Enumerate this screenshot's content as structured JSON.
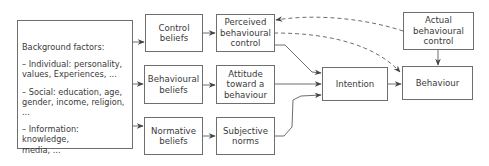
{
  "diagram": {
    "background": {
      "heading": "Background factors:",
      "items": [
        "– Individual: personality,\nvalues, Experiences, ...",
        "– Social: education, age,\ngender, income, religion, ...",
        "– Information: knowledge,\nmedia, ..."
      ]
    },
    "nodes": {
      "control_beliefs": "Control\nbeliefs",
      "behavioural_beliefs": "Behavioural\nbeliefs",
      "normative_beliefs": "Normative\nbeliefs",
      "perceived_control": "Perceived\nbehavioural\ncontrol",
      "attitude": "Attitude\ntoward a\nbehaviour",
      "subjective_norms": "Subjective\nnorms",
      "intention": "Intention",
      "actual_control": "Actual\nbehavioural\ncontrol",
      "behaviour": "Behaviour"
    },
    "edges": [
      {
        "from": "background",
        "to": "control_beliefs",
        "style": "solid"
      },
      {
        "from": "background",
        "to": "behavioural_beliefs",
        "style": "solid"
      },
      {
        "from": "background",
        "to": "normative_beliefs",
        "style": "solid"
      },
      {
        "from": "control_beliefs",
        "to": "perceived_control",
        "style": "solid"
      },
      {
        "from": "behavioural_beliefs",
        "to": "attitude",
        "style": "solid"
      },
      {
        "from": "normative_beliefs",
        "to": "subjective_norms",
        "style": "solid"
      },
      {
        "from": "perceived_control",
        "to": "intention",
        "style": "solid"
      },
      {
        "from": "attitude",
        "to": "intention",
        "style": "solid"
      },
      {
        "from": "subjective_norms",
        "to": "intention",
        "style": "solid"
      },
      {
        "from": "intention",
        "to": "behaviour",
        "style": "solid"
      },
      {
        "from": "actual_control",
        "to": "behaviour",
        "style": "solid"
      },
      {
        "from": "actual_control",
        "to": "perceived_control",
        "style": "dashed"
      },
      {
        "from": "perceived_control",
        "to": "behaviour",
        "style": "dashed"
      }
    ],
    "colors": {
      "stroke": "#6e6e6e",
      "arrow": "#444444",
      "text": "#3a3a3a",
      "background": "#ffffff"
    }
  }
}
